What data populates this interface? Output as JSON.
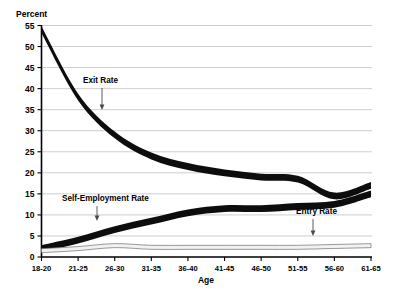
{
  "chart_data": {
    "type": "line",
    "title": "",
    "xlabel": "Age",
    "ylabel": "Percent",
    "ylim": [
      0,
      55
    ],
    "ytick_step": 5,
    "grid": true,
    "legend": "inline-annotations",
    "categories": [
      "18-20",
      "21-25",
      "26-30",
      "31-35",
      "36-40",
      "41-45",
      "46-50",
      "51-55",
      "56-60",
      "61-65"
    ],
    "ytick_labels": [
      "0",
      "5",
      "10",
      "15",
      "20",
      "25",
      "30",
      "35",
      "40",
      "45",
      "50",
      "55"
    ],
    "series": [
      {
        "name": "Exit Rate",
        "style": "thick-black-band",
        "values": [
          54,
          38,
          29,
          24,
          21.5,
          20,
          19,
          18.5,
          14.5,
          17
        ]
      },
      {
        "name": "Self-Employment Rate",
        "style": "thick-black-band",
        "values": [
          2,
          4,
          6.5,
          8.5,
          10.5,
          11.5,
          11.5,
          12,
          12.5,
          15
        ]
      },
      {
        "name": "Entry Rate",
        "style": "thin-white-band",
        "values": [
          1.5,
          2,
          2.7,
          2.3,
          2.3,
          2.3,
          2.3,
          2.3,
          2.5,
          2.7
        ]
      }
    ],
    "annotations": [
      {
        "text": "Exit Rate",
        "at_category": "26-30",
        "points_to": 35.5
      },
      {
        "text": "Self-Employment Rate",
        "at_category": "24",
        "points_to": 5.5
      },
      {
        "text": "Entry Rate",
        "at_category": "53-58",
        "points_to": 3.0
      }
    ],
    "colors": {
      "thick_series": "#0d0d0d",
      "thin_series_fill": "#f2f2f2",
      "thin_series_stroke": "#6e6e6e",
      "gridline": "#b9b9b9",
      "axis": "#000000",
      "background": "#ffffff"
    }
  },
  "axis": {
    "y_title": "Percent",
    "x_title": "Age"
  },
  "labels": {
    "exit_rate": "Exit Rate",
    "self_employment_rate": "Self-Employment Rate",
    "entry_rate": "Entry Rate"
  }
}
